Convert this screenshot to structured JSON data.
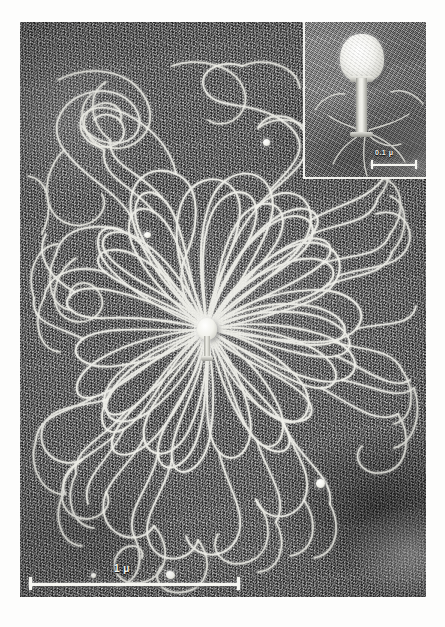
{
  "figure": {
    "kind": "electron-micrograph",
    "background_tone": "#6f6f6f"
  },
  "main_image": {
    "label": "main-micrograph",
    "scale_bar": {
      "label": "1 μ",
      "length_px": 211,
      "value": "1",
      "unit": "μ"
    },
    "center_particle": "phage-capsid-with-tail",
    "strand_count_visible": 36
  },
  "inset": {
    "label": "inset-micrograph",
    "content": "intact bacteriophage particle",
    "scale_bar": {
      "label": "0.1 μ",
      "length_px": 46,
      "value": "0.1",
      "unit": "μ"
    }
  },
  "particles": [
    {
      "name": "debris-particle-upper-right",
      "x": 243,
      "y": 117,
      "d": 7
    },
    {
      "name": "debris-particle-upper-left",
      "x": 124,
      "y": 210,
      "d": 7
    },
    {
      "name": "debris-particle-lower-right",
      "x": 296,
      "y": 457,
      "d": 9
    },
    {
      "name": "debris-particle-lower-left",
      "x": 71,
      "y": 551,
      "d": 5
    },
    {
      "name": "debris-particle-bottom-center",
      "x": 146,
      "y": 551,
      "d": 8
    }
  ],
  "colors": {
    "plate_background": "#fdfdfc",
    "film_gray": "#6f6f6f",
    "strand_white": "#f4f4ee",
    "scalebar_white": "#f6f6f1"
  }
}
